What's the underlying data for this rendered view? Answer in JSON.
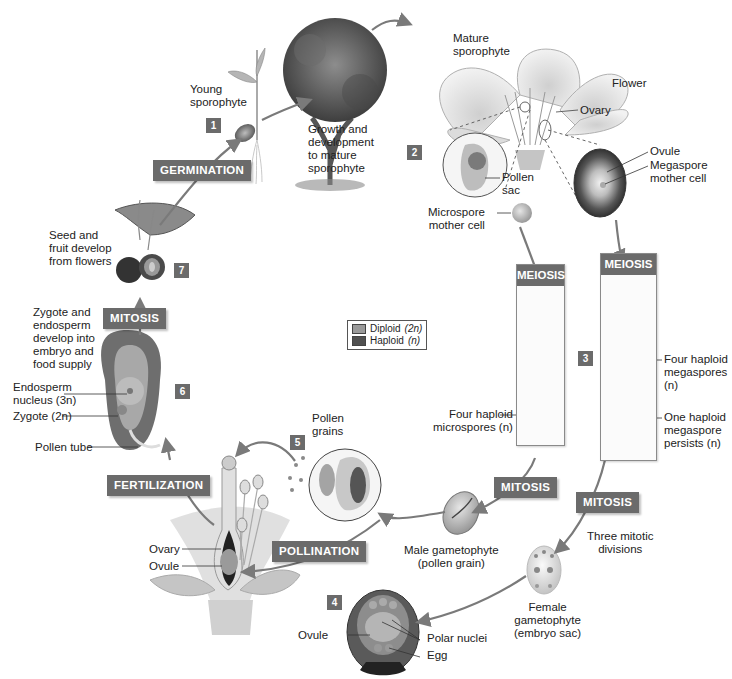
{
  "colors": {
    "stage_box": "#6b6b6b",
    "diploid": "#9a9a9a",
    "haploid": "#505050",
    "arrow": "#7a7a7a"
  },
  "legend": {
    "items": [
      {
        "label": "Diploid",
        "ploidy": "(2n)",
        "color": "#9a9a9a"
      },
      {
        "label": "Haploid",
        "ploidy": "(n)",
        "color": "#505050"
      }
    ]
  },
  "stages": {
    "germination": "GERMINATION",
    "meiosis_male": "MEIOSIS",
    "meiosis_female": "MEIOSIS",
    "mitosis_male": "MITOSIS",
    "mitosis_female": "MITOSIS",
    "mitosis_zygote": "MITOSIS",
    "pollination": "POLLINATION",
    "fertilization": "FERTILIZATION"
  },
  "step_numbers": [
    "1",
    "2",
    "3",
    "4",
    "5",
    "6",
    "7"
  ],
  "labels": {
    "young_sporophyte": "Young\nsporophyte",
    "growth": "Growth and\ndevelopment\nto mature\nsporophyte",
    "mature_sporophyte": "Mature\nsporophyte",
    "flower": "Flower",
    "ovary_top": "Ovary",
    "ovule_top": "Ovule",
    "megaspore_mother_cell": "Megaspore\nmother cell",
    "pollen_sac": "Pollen\nsac",
    "microspore_mother_cell": "Microspore\nmother cell",
    "four_haploid_microspores": "Four haploid\nmicrospores (n)",
    "four_haploid_megaspores": "Four haploid\nmegaspores\n(n)",
    "one_haploid_megaspore": "One haploid\nmegaspore\npersists (n)",
    "male_gametophyte": "Male gametophyte\n(pollen grain)",
    "three_mitotic_divisions": "Three mitotic\ndivisions",
    "female_gametophyte": "Female\ngametophyte\n(embryo sac)",
    "ovule_bottom": "Ovule",
    "polar_nuclei": "Polar nuclei",
    "egg": "Egg",
    "pollen_grains": "Pollen\ngrains",
    "ovary_flower": "Ovary",
    "ovule_flower": "Ovule",
    "pollen_tube": "Pollen tube",
    "zygote": "Zygote (2n)",
    "endosperm_nucleus": "Endosperm\nnucleus (3n)",
    "zygote_endosperm_develop": "Zygote and\nendosperm\ndevelop into\nembryo and\nfood supply",
    "seed_fruit": "Seed and\nfruit develop\nfrom flowers"
  }
}
